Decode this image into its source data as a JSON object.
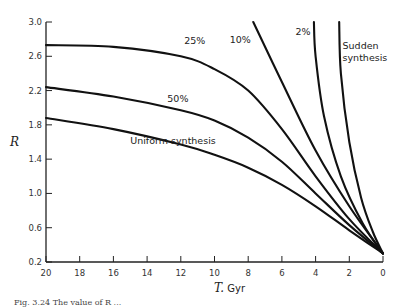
{
  "chart_data": {
    "type": "line",
    "title": "",
    "xlabel": "T, Gyr",
    "ylabel": "R",
    "xlim": [
      20,
      0
    ],
    "ylim": [
      0.2,
      3.0
    ],
    "x_reversed": true,
    "grid": false,
    "legend": "inline labels",
    "xticks": [
      20,
      18,
      16,
      14,
      12,
      10,
      8,
      6,
      4,
      2,
      0
    ],
    "yticks": [
      0.2,
      0.6,
      1.0,
      1.4,
      1.8,
      2.2,
      2.6,
      3.0
    ],
    "ytick_labels": [
      "0.2",
      "0.6",
      "1.0",
      "1.4",
      "1.8",
      "2.2",
      "2.6",
      "3.0"
    ],
    "series": [
      {
        "name": "25%",
        "label_pos": [
          11.8,
          2.74
        ],
        "x": [
          20,
          16,
          12,
          10,
          8,
          6,
          4,
          2,
          0
        ],
        "values": [
          2.73,
          2.71,
          2.6,
          2.45,
          2.2,
          1.75,
          1.2,
          0.7,
          0.3
        ]
      },
      {
        "name": "50%",
        "label_pos": [
          12.8,
          2.07
        ],
        "x": [
          20,
          16,
          12,
          10,
          8,
          6,
          4,
          2,
          0
        ],
        "values": [
          2.24,
          2.13,
          1.97,
          1.85,
          1.65,
          1.37,
          1.0,
          0.63,
          0.3
        ]
      },
      {
        "name": "Uniform synthesis",
        "label_pos": [
          15.0,
          1.58
        ],
        "x": [
          20,
          16,
          12,
          10,
          8,
          6,
          4,
          2,
          0
        ],
        "values": [
          1.88,
          1.75,
          1.57,
          1.45,
          1.3,
          1.1,
          0.85,
          0.57,
          0.3
        ]
      },
      {
        "name": "10%",
        "label_pos": [
          9.1,
          2.75
        ],
        "x": [
          7.7,
          6,
          4,
          2,
          0
        ],
        "values": [
          3.0,
          2.3,
          1.5,
          0.85,
          0.3
        ]
      },
      {
        "name": "2%",
        "label_pos": [
          5.2,
          2.85
        ],
        "x": [
          4.1,
          4.0,
          3.5,
          2.5,
          1.2,
          0
        ],
        "values": [
          3.0,
          2.6,
          1.9,
          1.2,
          0.65,
          0.3
        ]
      },
      {
        "name": "Sudden synthesis",
        "label_lines": [
          "Sudden",
          "synthesis"
        ],
        "label_pos": [
          2.4,
          2.68
        ],
        "x": [
          2.6,
          2.5,
          2.0,
          1.3,
          0.6,
          0
        ],
        "values": [
          3.0,
          2.4,
          1.6,
          0.95,
          0.55,
          0.3
        ]
      }
    ]
  },
  "caption": "Fig. 3.24   The value of R ..."
}
